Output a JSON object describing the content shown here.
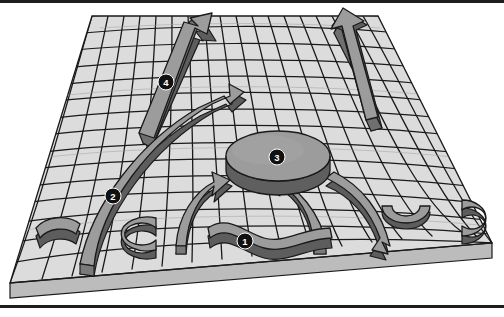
{
  "figure": {
    "caption": "",
    "background_color": "#ffffff",
    "border": {
      "top_color": "#1d1d1d",
      "bottom_color": "#1d1d1d",
      "style": "thin horizontal rules at top and bottom of frame"
    },
    "surface": {
      "name": "warped-grid-sheet",
      "description": "A quadrilateral mesh sheet drawn in oblique projection, warped with gentle bumps, shown with a slab thickness along the front edge",
      "fill_color": "#d8d8d8",
      "tile_fill_color": "#dcdcdc",
      "grid_line_color": "#1a1a1a",
      "slab_side_color": "#bcbcbc",
      "slab_edge_color": "#1a1a1a",
      "columns": 18,
      "rows": 14
    },
    "palette": {
      "object_top": "#9a9a9a",
      "object_top_light": "#a8a8a8",
      "object_side": "#6f6f6f",
      "object_side_dark": "#5d5d5d",
      "object_outline": "#1a1a1a",
      "label_circle": "#111111",
      "label_text": "#ffffff",
      "paper": "#ffffff"
    },
    "labels": [
      {
        "id": "label-1",
        "text": "1",
        "x": 245,
        "y": 241,
        "target": "wavy-ribbon-front-center"
      },
      {
        "id": "label-2",
        "text": "2",
        "x": 113,
        "y": 196,
        "target": "long-curved-arrow-left"
      },
      {
        "id": "label-3",
        "text": "3",
        "x": 277,
        "y": 157,
        "target": "central-disc"
      },
      {
        "id": "label-4",
        "text": "4",
        "x": 166,
        "y": 82,
        "target": "straight-arrow-upper-left"
      }
    ],
    "objects": [
      {
        "id": "straight-arrow-upper-left",
        "name": "straight-arrow-upper-left",
        "kind": "straight-arrow",
        "label": "4"
      },
      {
        "id": "straight-arrow-upper-right",
        "name": "straight-arrow-upper-right",
        "kind": "straight-arrow",
        "label": ""
      },
      {
        "id": "long-curved-arrow-left",
        "name": "long-curved-arrow-left",
        "kind": "curved-arrow",
        "label": "2"
      },
      {
        "id": "curved-arrow-center-left",
        "name": "curved-arrow-center-left",
        "kind": "curved-arrow",
        "label": ""
      },
      {
        "id": "curved-arrow-center-right",
        "name": "curved-arrow-center-right",
        "kind": "curved-arrow",
        "label": ""
      },
      {
        "id": "long-curved-arrow-right",
        "name": "long-curved-arrow-right",
        "kind": "curved-arrow",
        "label": ""
      },
      {
        "id": "central-disc",
        "name": "central-disc",
        "kind": "disc",
        "label": "3"
      },
      {
        "id": "wavy-ribbon-front-center",
        "name": "wavy-ribbon-front-center",
        "kind": "wavy-ribbon",
        "label": "1"
      },
      {
        "id": "crescent-front-left",
        "name": "crescent-front-left",
        "kind": "crescent",
        "label": ""
      },
      {
        "id": "crescent-left-mid",
        "name": "crescent-left-mid",
        "kind": "crescent",
        "label": ""
      },
      {
        "id": "crescent-front-right",
        "name": "crescent-front-right",
        "kind": "crescent",
        "label": ""
      },
      {
        "id": "crescent-right-edge",
        "name": "crescent-right-edge",
        "kind": "crescent",
        "label": ""
      }
    ]
  }
}
